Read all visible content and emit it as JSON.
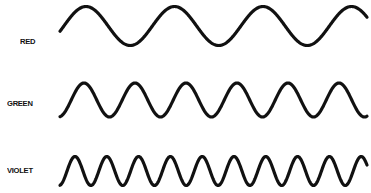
{
  "diagram": {
    "title": "",
    "rows": [
      {
        "label": "RED",
        "label_x": 20,
        "label_y": 37,
        "x_start": 60,
        "x_end": 367,
        "y_center": 26,
        "amplitude": 19.5,
        "period": 88.5,
        "phase_x": 86,
        "color": "#111111"
      },
      {
        "label": "GREEN",
        "label_x": 7,
        "label_y": 99,
        "x_start": 60,
        "x_end": 367,
        "y_center": 100,
        "amplitude": 17,
        "period": 51,
        "phase_x": 84,
        "color": "#111111"
      },
      {
        "label": "VIOLET",
        "label_x": 7,
        "label_y": 166,
        "x_start": 60,
        "x_end": 367,
        "y_center": 171,
        "amplitude": 14.5,
        "period": 31.8,
        "phase_x": 75,
        "color": "#111111"
      }
    ]
  },
  "chart_data": {
    "type": "line",
    "title": "",
    "series": [
      {
        "name": "RED",
        "relative_wavelength": 88.5,
        "cycles_shown": 3.5
      },
      {
        "name": "GREEN",
        "relative_wavelength": 51,
        "cycles_shown": 6
      },
      {
        "name": "VIOLET",
        "relative_wavelength": 31.8,
        "cycles_shown": 9.7
      }
    ],
    "xlabel": "",
    "ylabel": "",
    "grid": false,
    "legend": "none"
  }
}
